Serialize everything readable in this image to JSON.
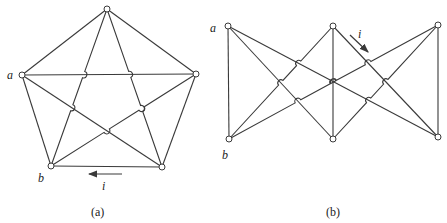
{
  "colors": {
    "stroke": "#3a3a3a",
    "background": "#ffffff"
  },
  "figures": [
    {
      "id": "a",
      "caption": "(a)",
      "caption_pos": [
        91,
        206
      ],
      "nodes": {
        "T": [
          107,
          9
        ],
        "A": [
          22,
          75
        ],
        "R": [
          196,
          74
        ],
        "B": [
          51,
          166
        ],
        "BR": [
          162,
          167
        ]
      },
      "edges": [
        [
          "T",
          "A"
        ],
        [
          "T",
          "R"
        ],
        [
          "A",
          "B"
        ],
        [
          "R",
          "BR"
        ],
        [
          "B",
          "BR"
        ],
        [
          "T",
          "B"
        ],
        [
          "T",
          "BR"
        ],
        [
          "A",
          "R"
        ],
        [
          "A",
          "BR"
        ],
        [
          "R",
          "B"
        ]
      ],
      "hop_edges": [
        [
          "T",
          "B"
        ],
        [
          "T",
          "BR"
        ],
        [
          "R",
          "B"
        ]
      ],
      "labels": [
        {
          "text": "a",
          "pos": [
            7,
            69
          ]
        },
        {
          "text": "b",
          "pos": [
            38,
            172
          ]
        },
        {
          "text": "i",
          "pos": [
            102,
            180
          ]
        }
      ],
      "arrow": {
        "from": [
          122,
          174
        ],
        "to": [
          89,
          174
        ]
      }
    },
    {
      "id": "b",
      "caption": "(b)",
      "caption_pos": [
        326,
        206
      ],
      "nodes": {
        "A": [
          228,
          26
        ],
        "M": [
          333,
          26
        ],
        "R": [
          438,
          25
        ],
        "B": [
          229,
          139
        ],
        "MB": [
          333,
          139
        ],
        "RB": [
          438,
          137
        ]
      },
      "edges": [
        [
          "A",
          "B"
        ],
        [
          "M",
          "MB"
        ],
        [
          "R",
          "RB"
        ],
        [
          "A",
          "MB"
        ],
        [
          "A",
          "RB"
        ],
        [
          "B",
          "M"
        ],
        [
          "B",
          "R"
        ],
        [
          "M",
          "RB"
        ],
        [
          "MB",
          "R"
        ]
      ],
      "hop_edges": [
        [
          "B",
          "M"
        ],
        [
          "B",
          "R"
        ],
        [
          "MB",
          "R"
        ]
      ],
      "labels": [
        {
          "text": "a",
          "pos": [
            210,
            22
          ]
        },
        {
          "text": "b",
          "pos": [
            222,
            149
          ]
        },
        {
          "text": "i",
          "pos": [
            358,
            28
          ]
        }
      ],
      "arrow": {
        "from": [
          350,
          35
        ],
        "to": [
          368,
          52
        ]
      }
    }
  ]
}
